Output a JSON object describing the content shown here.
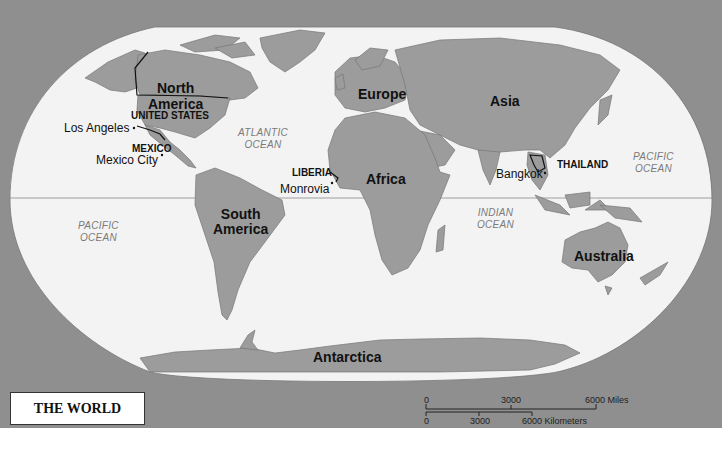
{
  "map": {
    "title": "THE WORLD",
    "colors": {
      "frame": "#8f8f8f",
      "ocean": "#f3f3f3",
      "land": "#9c9c9c",
      "text": "#111111",
      "ocean_text": "#7a7a7a"
    },
    "continents": [
      {
        "id": "north-america",
        "label_line1": "North",
        "label_line2": "America"
      },
      {
        "id": "south-america",
        "label_line1": "South",
        "label_line2": "America"
      },
      {
        "id": "europe",
        "label": "Europe"
      },
      {
        "id": "asia",
        "label": "Asia"
      },
      {
        "id": "africa",
        "label": "Africa"
      },
      {
        "id": "australia",
        "label": "Australia"
      },
      {
        "id": "antarctica",
        "label": "Antarctica"
      }
    ],
    "countries": [
      {
        "id": "united-states",
        "label": "UNITED STATES"
      },
      {
        "id": "mexico",
        "label": "MEXICO"
      },
      {
        "id": "liberia",
        "label": "LIBERIA"
      },
      {
        "id": "thailand",
        "label": "THAILAND"
      }
    ],
    "cities": [
      {
        "id": "los-angeles",
        "label": "Los Angeles"
      },
      {
        "id": "mexico-city",
        "label": "Mexico City"
      },
      {
        "id": "monrovia",
        "label": "Monrovia"
      },
      {
        "id": "bangkok",
        "label": "Bangkok"
      }
    ],
    "oceans": [
      {
        "id": "atlantic",
        "line1": "ATLANTIC",
        "line2": "OCEAN"
      },
      {
        "id": "pacific-west",
        "line1": "PACIFIC",
        "line2": "OCEAN"
      },
      {
        "id": "pacific-east",
        "line1": "PACIFIC",
        "line2": "OCEAN"
      },
      {
        "id": "indian",
        "line1": "INDIAN",
        "line2": "OCEAN"
      }
    ],
    "scale_bar": {
      "miles": {
        "ticks": [
          "0",
          "3000",
          "6000"
        ],
        "unit": "Miles"
      },
      "kilometers": {
        "ticks": [
          "0",
          "3000",
          "6000"
        ],
        "unit": "Kilometers"
      }
    }
  }
}
